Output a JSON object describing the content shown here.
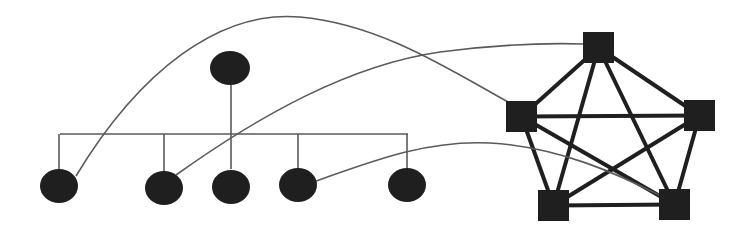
{
  "diagram": {
    "type": "network-topology",
    "colors": {
      "background": "#ffffff",
      "node_fill": "#1f1f1f",
      "bus_line": "#5a5a5a",
      "mesh_line": "#1f1f1f",
      "link_curve": "#5a5a5a"
    },
    "bus_topology": {
      "root": {
        "id": "root",
        "shape": "ellipse",
        "cx": 230,
        "cy": 68,
        "rx": 20,
        "ry": 17
      },
      "bus": {
        "y": 134,
        "x1": 60,
        "x2": 408
      },
      "root_drop": {
        "x": 231,
        "y1": 85,
        "y2": 169
      },
      "children": [
        {
          "id": "c1",
          "shape": "ellipse",
          "cx": 59,
          "cy": 186,
          "rx": 19,
          "ry": 17
        },
        {
          "id": "c2",
          "shape": "ellipse",
          "cx": 164,
          "cy": 188,
          "rx": 19,
          "ry": 17
        },
        {
          "id": "c3",
          "shape": "ellipse",
          "cx": 231,
          "cy": 187,
          "rx": 19,
          "ry": 17
        },
        {
          "id": "c4",
          "shape": "ellipse",
          "cx": 298,
          "cy": 185,
          "rx": 19,
          "ry": 17
        },
        {
          "id": "c5",
          "shape": "ellipse",
          "cx": 407,
          "cy": 185,
          "rx": 19,
          "ry": 17
        }
      ]
    },
    "mesh_topology": {
      "nodes": [
        {
          "id": "top",
          "shape": "square",
          "x": 583,
          "y": 32,
          "size": 31
        },
        {
          "id": "left",
          "shape": "square",
          "x": 506,
          "y": 101,
          "size": 31
        },
        {
          "id": "right",
          "shape": "square",
          "x": 684,
          "y": 100,
          "size": 31
        },
        {
          "id": "bottom-left",
          "shape": "square",
          "x": 538,
          "y": 190,
          "size": 31
        },
        {
          "id": "bottom-right",
          "shape": "square",
          "x": 659,
          "y": 189,
          "size": 31
        }
      ],
      "edges": [
        [
          "top",
          "left"
        ],
        [
          "top",
          "right"
        ],
        [
          "top",
          "bottom-left"
        ],
        [
          "top",
          "bottom-right"
        ],
        [
          "left",
          "right"
        ],
        [
          "left",
          "bottom-left"
        ],
        [
          "left",
          "bottom-right"
        ],
        [
          "right",
          "bottom-left"
        ],
        [
          "right",
          "bottom-right"
        ],
        [
          "bottom-left",
          "bottom-right"
        ]
      ]
    },
    "cross_links": [
      {
        "from": "c1",
        "to": "left",
        "path": "M 76 176 C 140 70, 220 10, 300 17 C 380 24, 450 70, 508 102"
      },
      {
        "from": "c2",
        "to": "top",
        "path": "M 176 175 C 260 115, 350 65, 440 52 C 500 44, 550 43, 584 44"
      },
      {
        "from": "c4",
        "to": "bottom-right",
        "path": "M 316 181 C 380 158, 430 140, 490 143 C 560 147, 620 175, 661 196"
      }
    ]
  }
}
